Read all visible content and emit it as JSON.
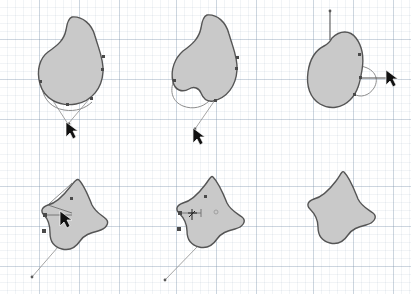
{
  "figure": {
    "panel_count": 6,
    "rows": 2,
    "cols": 3,
    "canvas_background": "#ffffff",
    "grid": {
      "visible": true,
      "fine_spacing_px": 8,
      "major_spacing_px": 40,
      "fine_color": "#9bb0c4",
      "major_color": "#7891aa"
    },
    "shape_style": {
      "fill_color": "#c9c9c9",
      "stroke_color": "#555555",
      "stroke_width_px": 1.4
    },
    "handle_style": {
      "line_color": "#6e6e6e",
      "ghost_color": "#8d8d8d",
      "node_color": "#4a4a4a"
    }
  },
  "panels": [
    {
      "id": "panel-1",
      "index": 1,
      "position": "top-left",
      "caption": "Rounded teardrop blob with selected path nodes and a drag handle pulled down-left",
      "shape_name": "teardrop-blob",
      "cursor": {
        "type": "arrow-pointer",
        "x": 68,
        "y": 128
      },
      "nodes_visible": 5,
      "handles_visible": true,
      "ghost_preview": true
    },
    {
      "id": "panel-2",
      "index": 2,
      "position": "top-center",
      "caption": "Same blob with a notch beginning to form along the lower-left edge",
      "shape_name": "teardrop-blob-notched",
      "cursor": {
        "type": "arrow-pointer",
        "x": 58,
        "y": 133
      },
      "nodes_visible": 4,
      "handles_visible": true,
      "ghost_preview": true
    },
    {
      "id": "panel-3",
      "index": 3,
      "position": "top-right",
      "caption": "Blob reshaped with vertical and horizontal guide arms extended from the node",
      "shape_name": "blob-with-arms",
      "cursor": {
        "type": "arrow-pointer",
        "x": 93,
        "y": 77
      },
      "nodes_visible": 5,
      "handles_visible": true,
      "ghost_preview": true
    },
    {
      "id": "panel-4",
      "index": 4,
      "position": "bottom-left",
      "caption": "Fin-shaped form with horizontal node handle being dragged inward",
      "shape_name": "fin-shape",
      "cursor": {
        "type": "arrow-pointer",
        "x": 62,
        "y": 72
      },
      "nodes_visible": 4,
      "handles_visible": true,
      "ghost_preview": true
    },
    {
      "id": "panel-5",
      "index": 5,
      "position": "bottom-center",
      "caption": "Fin shape with node selection marker and move cursor over the interior",
      "shape_name": "fin-shape-selected",
      "cursor": {
        "type": "move-crosshair",
        "x": 55,
        "y": 68
      },
      "nodes_visible": 3,
      "handles_visible": true,
      "ghost_preview": true
    },
    {
      "id": "panel-6",
      "index": 6,
      "position": "bottom-right",
      "caption": "Finished fin shape rendered with no editing handles or nodes",
      "shape_name": "fin-shape-final",
      "cursor": null,
      "nodes_visible": 0,
      "handles_visible": false,
      "ghost_preview": false
    }
  ]
}
